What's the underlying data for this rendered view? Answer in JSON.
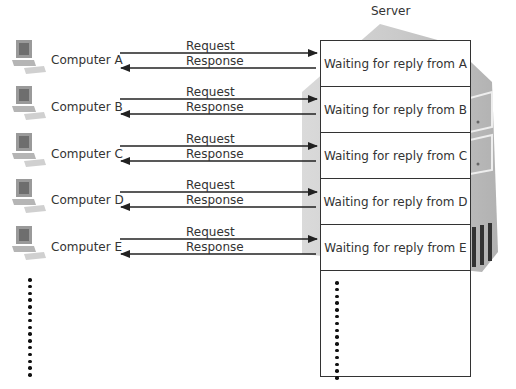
{
  "server": {
    "label": "Server",
    "body_color": "#c8c8c8",
    "slots": [
      {
        "label": "Waiting for reply from A"
      },
      {
        "label": "Waiting for reply from B"
      },
      {
        "label": "Waiting for reply from C"
      },
      {
        "label": "Waiting for reply from D"
      },
      {
        "label": "Waiting for reply from E"
      }
    ],
    "continuation": "vertical-ellipsis-dots"
  },
  "clients": [
    {
      "label": "Computer A",
      "icon": "desktop-computer-icon",
      "request_label": "Request",
      "response_label": "Response"
    },
    {
      "label": "Computer B",
      "icon": "desktop-computer-icon",
      "request_label": "Request",
      "response_label": "Response"
    },
    {
      "label": "Computer C",
      "icon": "desktop-computer-icon",
      "request_label": "Request",
      "response_label": "Response"
    },
    {
      "label": "Computer D",
      "icon": "desktop-computer-icon",
      "request_label": "Request",
      "response_label": "Response"
    },
    {
      "label": "Computer E",
      "icon": "desktop-computer-icon",
      "request_label": "Request",
      "response_label": "Response"
    }
  ],
  "client_continuation": "vertical-ellipsis-dots",
  "colors": {
    "line": "#222222",
    "text": "#333333",
    "server_gray": "#c8c8c8"
  }
}
